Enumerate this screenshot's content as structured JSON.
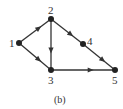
{
  "diagram": {
    "caption": "(b)",
    "nodes": [
      {
        "id": "1",
        "label": "1"
      },
      {
        "id": "2",
        "label": "2"
      },
      {
        "id": "3",
        "label": "3"
      },
      {
        "id": "4",
        "label": "4"
      },
      {
        "id": "5",
        "label": "5"
      }
    ],
    "edges": [
      {
        "from": "1",
        "to": "2"
      },
      {
        "from": "1",
        "to": "3"
      },
      {
        "from": "2",
        "to": "3"
      },
      {
        "from": "2",
        "to": "4"
      },
      {
        "from": "4",
        "to": "5"
      },
      {
        "from": "3",
        "to": "5"
      }
    ],
    "colors": {
      "stroke": "#333333",
      "node": "#222222"
    }
  }
}
